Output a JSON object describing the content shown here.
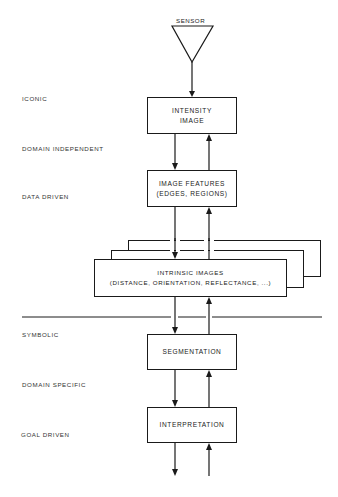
{
  "sensor": {
    "label": "SENSOR"
  },
  "levels": [
    {
      "label": "ICONIC"
    },
    {
      "label": "DOMAIN INDEPENDENT"
    },
    {
      "label": "DATA DRIVEN"
    },
    {
      "label": "SYMBOLIC"
    },
    {
      "label": "DOMAIN SPECIFIC"
    },
    {
      "label": "GOAL DRIVEN"
    }
  ],
  "boxes": {
    "intensity": {
      "line1": "INTENSITY",
      "line2": "IMAGE"
    },
    "features": {
      "line1": "IMAGE FEATURES",
      "line2": "(EDGES, REGIONS)"
    },
    "intrinsic": {
      "line1": "INTRINSIC IMAGES",
      "line2": "(DISTANCE, ORIENTATION, REFLECTANCE, ...)"
    },
    "segmentation": {
      "line1": "SEGMENTATION"
    },
    "interpretation": {
      "line1": "INTERPRETATION"
    }
  },
  "colors": {
    "ink": "#1a1a1a",
    "background": "#ffffff"
  }
}
